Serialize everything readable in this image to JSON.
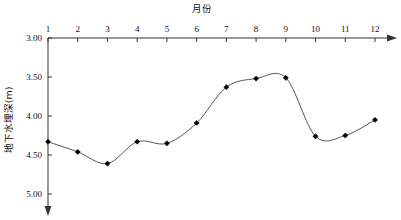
{
  "chart_data": {
    "type": "line",
    "title": "",
    "xlabel": "月份",
    "ylabel": "地下水埋深(m)",
    "x": [
      1,
      2,
      3,
      4,
      5,
      6,
      7,
      8,
      9,
      10,
      11,
      12
    ],
    "xtick_labels": [
      "1",
      "2",
      "3",
      "4",
      "5",
      "6",
      "7",
      "8",
      "9",
      "10",
      "11",
      "12"
    ],
    "ytick_labels": [
      "3.00",
      "3.50",
      "4.00",
      "4.50",
      "5.00"
    ],
    "ytick_values": [
      3.0,
      3.5,
      4.0,
      4.5,
      5.0
    ],
    "ylim": [
      3.0,
      5.0
    ],
    "y_axis_inverted": true,
    "xlim": [
      1,
      12
    ],
    "values": [
      4.33,
      4.46,
      4.61,
      4.33,
      4.35,
      4.09,
      3.63,
      3.52,
      3.51,
      4.26,
      4.25,
      4.05
    ],
    "grid": false,
    "legend": null,
    "marker": "diamond",
    "line_color": "#555555",
    "marker_color": "#000000",
    "axis_color": "#333333",
    "x_axis_position": "top",
    "x_axis_arrow": true,
    "y_axis_arrow": true
  }
}
